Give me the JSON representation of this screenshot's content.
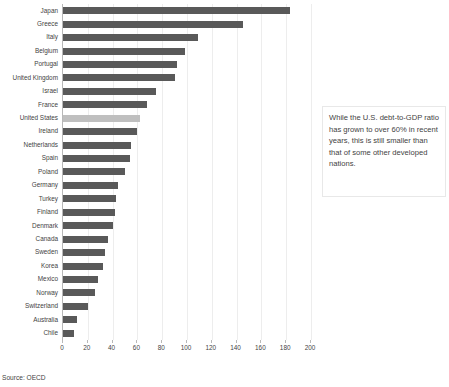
{
  "chart_data": {
    "type": "bar",
    "orientation": "horizontal",
    "title": "",
    "xlabel": "",
    "ylabel": "",
    "xlim": [
      0,
      200
    ],
    "xticks": [
      0,
      20,
      40,
      60,
      80,
      100,
      120,
      140,
      160,
      180,
      200
    ],
    "grid": true,
    "legend": false,
    "bar_color": "#595959",
    "highlight_color": "#bfbfbf",
    "highlight_category": "United States",
    "categories": [
      "Japan",
      "Greece",
      "Italy",
      "Belgium",
      "Portugal",
      "United Kingdom",
      "Israel",
      "France",
      "United States",
      "Ireland",
      "Netherlands",
      "Spain",
      "Poland",
      "Germany",
      "Turkey",
      "Finland",
      "Denmark",
      "Canada",
      "Sweden",
      "Korea",
      "Mexico",
      "Norway",
      "Switzerland",
      "Australia",
      "Chile"
    ],
    "values": [
      183,
      145,
      109,
      98,
      92,
      90,
      75,
      68,
      62,
      60,
      55,
      54,
      50,
      44,
      43,
      42,
      40,
      36,
      34,
      32,
      28,
      26,
      20,
      11,
      9
    ]
  },
  "source": {
    "note": "Source: OECD"
  },
  "callout": {
    "text": "While the U.S. debt-to-GDP ratio has grown to over 60% in recent years, this is still smaller than that of some other developed nations."
  }
}
